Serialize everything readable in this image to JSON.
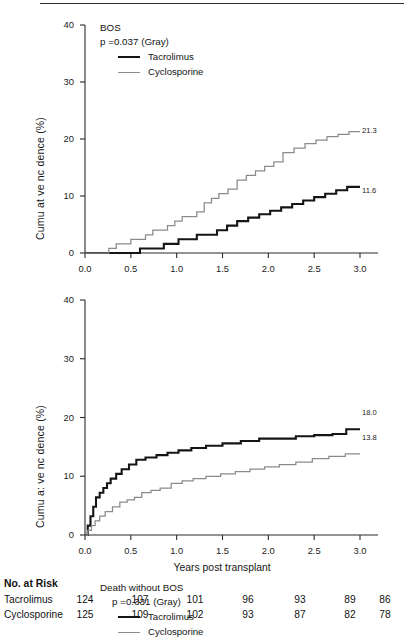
{
  "figure": {
    "x_axis_title": "Years post transplant",
    "y_axis_title": "Cumu at ve nc dence (%)",
    "y_axis_title_alt": "Cumu a: ve nc dence (%)"
  },
  "panels": [
    {
      "id": "bos",
      "legend_title": "BOS",
      "p_value_text": "p =0.037 (Gray)",
      "series_labels": [
        "Tacrolimus",
        "Cyclosporine"
      ],
      "endpoint_tacrolimus": "11.6",
      "endpoint_cyclosporine": "21.3",
      "y_ticks": [
        "0",
        "10",
        "20",
        "30",
        "40"
      ],
      "x_ticks": [
        "0.0",
        "0.5",
        "1.0",
        "1.5",
        "2.0",
        "2.5",
        "3.0"
      ]
    },
    {
      "id": "death",
      "legend_title": "Death without BOS",
      "p_value_text": "p =0.331 (Gray)",
      "series_labels": [
        "Tacrolimus",
        "Cyclosporine"
      ],
      "endpoint_tacrolimus": "18.0",
      "endpoint_cyclosporine": "13.8",
      "y_ticks": [
        "0",
        "10",
        "20",
        "30",
        "40"
      ],
      "x_ticks": [
        "0.0",
        "0.5",
        "1.0",
        "1.5",
        "2.0",
        "2.5",
        "3.0"
      ]
    }
  ],
  "risk_table": {
    "title": "No. at Risk",
    "rows": [
      {
        "name": "Tacrolimus",
        "values": [
          "124",
          "107",
          "101",
          "96",
          "93",
          "89",
          "86"
        ]
      },
      {
        "name": "Cyclosporine",
        "values": [
          "125",
          "109",
          "102",
          "93",
          "87",
          "82",
          "78"
        ]
      }
    ]
  },
  "colors": {
    "tacrolimus": "#151515",
    "cyclosporine": "#8b8b8b",
    "axis": "#2b2b2b",
    "text": "#1a1a1a"
  },
  "chart_data": [
    {
      "type": "line",
      "subtype": "cumulative-incidence-step",
      "title": "BOS",
      "annotation": "p =0.037 (Gray)",
      "xlabel": "Years post transplant",
      "ylabel": "Cumu at ve nc dence (%)",
      "xlim": [
        0.0,
        3.0
      ],
      "ylim": [
        0,
        40
      ],
      "xticks": [
        0.0,
        0.5,
        1.0,
        1.5,
        2.0,
        2.5,
        3.0
      ],
      "yticks": [
        0,
        10,
        20,
        30,
        40
      ],
      "grid": false,
      "legend_position": "top-left-inside",
      "series": [
        {
          "name": "Tacrolimus",
          "color": "#151515",
          "final_value": 11.6,
          "x": [
            0.0,
            0.3,
            0.46,
            0.6,
            0.72,
            0.86,
            0.95,
            1.02,
            1.12,
            1.22,
            1.32,
            1.44,
            1.55,
            1.66,
            1.78,
            1.9,
            2.02,
            2.14,
            2.26,
            2.38,
            2.5,
            2.62,
            2.74,
            2.86,
            3.0
          ],
          "y": [
            0.0,
            0.0,
            0.0,
            0.8,
            0.8,
            1.6,
            1.6,
            2.4,
            2.4,
            3.2,
            3.2,
            4.0,
            4.8,
            5.6,
            6.2,
            6.8,
            7.4,
            8.0,
            8.6,
            9.2,
            9.8,
            10.4,
            11.0,
            11.6,
            11.6
          ]
        },
        {
          "name": "Cyclosporine",
          "color": "#8b8b8b",
          "final_value": 21.3,
          "x": [
            0.0,
            0.18,
            0.26,
            0.34,
            0.42,
            0.5,
            0.58,
            0.66,
            0.74,
            0.82,
            0.9,
            0.98,
            1.06,
            1.14,
            1.22,
            1.3,
            1.38,
            1.46,
            1.56,
            1.66,
            1.76,
            1.86,
            1.96,
            2.06,
            2.16,
            2.28,
            2.4,
            2.52,
            2.64,
            2.76,
            2.88,
            3.0
          ],
          "y": [
            0.0,
            0.0,
            0.8,
            1.6,
            1.6,
            2.4,
            2.4,
            3.2,
            4.0,
            4.0,
            4.8,
            5.6,
            6.4,
            6.4,
            7.2,
            8.8,
            9.6,
            10.4,
            11.2,
            12.8,
            13.6,
            14.4,
            15.2,
            16.0,
            17.6,
            18.4,
            19.2,
            19.8,
            20.4,
            20.8,
            21.3,
            21.3
          ]
        }
      ]
    },
    {
      "type": "line",
      "subtype": "cumulative-incidence-step",
      "title": "Death without BOS",
      "annotation": "p =0.331 (Gray)",
      "xlabel": "Years post transplant",
      "ylabel": "Cumu a: ve nc dence (%)",
      "xlim": [
        0.0,
        3.0
      ],
      "ylim": [
        0,
        40
      ],
      "xticks": [
        0.0,
        0.5,
        1.0,
        1.5,
        2.0,
        2.5,
        3.0
      ],
      "yticks": [
        0,
        10,
        20,
        30,
        40
      ],
      "grid": false,
      "legend_position": "top-left-inside",
      "series": [
        {
          "name": "Tacrolimus",
          "color": "#151515",
          "final_value": 18.0,
          "x": [
            0.0,
            0.03,
            0.06,
            0.09,
            0.12,
            0.16,
            0.2,
            0.24,
            0.28,
            0.34,
            0.4,
            0.48,
            0.56,
            0.66,
            0.78,
            0.9,
            1.02,
            1.16,
            1.32,
            1.5,
            1.7,
            1.9,
            2.1,
            2.3,
            2.5,
            2.7,
            2.85,
            3.0
          ],
          "y": [
            0.0,
            1.6,
            3.2,
            4.8,
            6.4,
            7.2,
            8.0,
            8.8,
            9.6,
            10.4,
            11.2,
            12.0,
            12.8,
            13.2,
            13.6,
            14.0,
            14.4,
            14.8,
            15.2,
            15.6,
            16.0,
            16.4,
            16.4,
            16.8,
            17.0,
            17.2,
            18.0,
            18.0
          ]
        },
        {
          "name": "Cyclosporine",
          "color": "#8b8b8b",
          "final_value": 13.8,
          "x": [
            0.0,
            0.03,
            0.07,
            0.11,
            0.16,
            0.22,
            0.3,
            0.38,
            0.46,
            0.54,
            0.62,
            0.72,
            0.82,
            0.94,
            1.06,
            1.18,
            1.32,
            1.48,
            1.64,
            1.8,
            1.96,
            2.12,
            2.3,
            2.48,
            2.66,
            2.84,
            3.0
          ],
          "y": [
            0.0,
            0.8,
            1.6,
            2.4,
            3.2,
            4.0,
            4.8,
            5.6,
            6.0,
            6.4,
            7.2,
            7.6,
            8.0,
            8.8,
            9.2,
            9.6,
            10.0,
            10.4,
            10.8,
            11.2,
            11.6,
            12.0,
            12.4,
            13.0,
            13.4,
            13.8,
            13.8
          ]
        }
      ]
    }
  ]
}
